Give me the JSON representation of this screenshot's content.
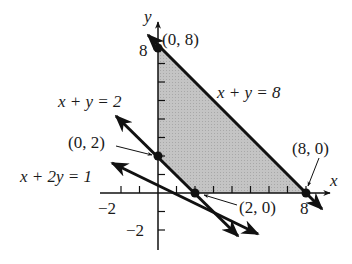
{
  "figure": {
    "type": "linear-programming-feasible-region",
    "colors": {
      "region_fill": "#bdbdbd",
      "line": "#111111",
      "background": "#ffffff"
    },
    "axes": {
      "x_label": "x",
      "y_label": "y",
      "x_ticks": [
        -2,
        -1,
        1,
        2,
        3,
        4,
        5,
        6,
        7,
        8
      ],
      "y_ticks": [
        -2,
        -1,
        1,
        2,
        3,
        4,
        5,
        6,
        7,
        8
      ],
      "x_tick_labels": [
        {
          "value": -2,
          "text": "−2"
        },
        {
          "value": 8,
          "text": "8"
        }
      ],
      "y_tick_labels": [
        {
          "value": -2,
          "text": "−2"
        },
        {
          "value": 8,
          "text": "8"
        }
      ]
    },
    "lines": [
      {
        "id": "line-8",
        "label": "x + y = 8"
      },
      {
        "id": "line-2",
        "label": "x + y = 2"
      },
      {
        "id": "line-x2y",
        "label": "x + 2y = 1"
      }
    ],
    "points": [
      {
        "id": "p08",
        "label": "(0, 8)",
        "x": 0,
        "y": 8
      },
      {
        "id": "p02",
        "label": "(0, 2)",
        "x": 0,
        "y": 2
      },
      {
        "id": "p20",
        "label": "(2, 0)",
        "x": 2,
        "y": 0
      },
      {
        "id": "p80",
        "label": "(8, 0)",
        "x": 8,
        "y": 0
      }
    ],
    "shaded_region_vertices": [
      [
        0,
        8
      ],
      [
        0,
        2
      ],
      [
        2,
        0
      ],
      [
        8,
        0
      ]
    ]
  }
}
